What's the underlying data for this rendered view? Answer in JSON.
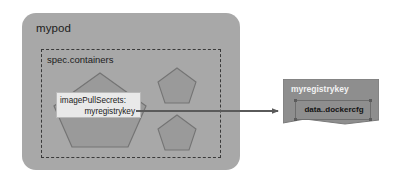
{
  "diagram": {
    "background_color": "#ffffff",
    "pod": {
      "label": "mypod",
      "fill_color": "#a8a8a8"
    },
    "spec_containers": {
      "label": "spec.containers",
      "border_style": "dashed",
      "border_color": "#3a3a3a"
    },
    "containers": [
      {
        "name": "container-large",
        "shape": "pentagon",
        "fill_color": "#9a9a9a"
      },
      {
        "name": "container-small-top",
        "shape": "pentagon",
        "fill_color": "#9a9a9a"
      },
      {
        "name": "container-small-bottom",
        "shape": "pentagon",
        "fill_color": "#9a9a9a"
      }
    ],
    "image_pull_secrets": {
      "key_label": "imagePullSecrets:",
      "value_label": "myregistrykey",
      "fill_color": "#e9e9e9"
    },
    "arrow": {
      "name": "reference-arrow",
      "direction": "right",
      "color": "#5a5a5a"
    },
    "secret": {
      "title": "myregistrykey",
      "data_key": "data..dockercfg",
      "fill_color": "#8e8e8e",
      "inner_fill_color": "#8e8e8e"
    }
  }
}
